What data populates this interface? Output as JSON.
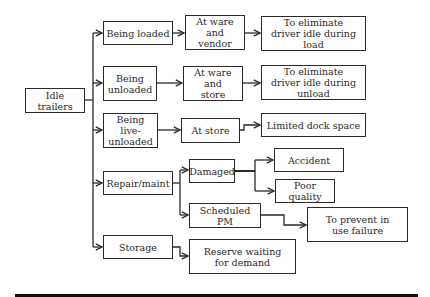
{
  "diagram": {
    "type": "tree",
    "root": {
      "id": "idle",
      "label": "Idle trailers"
    },
    "nodes": [
      {
        "id": "idle",
        "label": "Idle trailers",
        "x": 25,
        "y": 88,
        "w": 60,
        "h": 25
      },
      {
        "id": "loaded",
        "label": "Being loaded",
        "x": 103,
        "y": 21,
        "w": 70,
        "h": 24
      },
      {
        "id": "unloaded",
        "label": "Being unloaded",
        "x": 103,
        "y": 66,
        "w": 54,
        "h": 35
      },
      {
        "id": "live",
        "label": "Being live-unloaded",
        "x": 103,
        "y": 113,
        "w": 55,
        "h": 35
      },
      {
        "id": "repair",
        "label": "Repair/maint",
        "x": 103,
        "y": 171,
        "w": 70,
        "h": 24
      },
      {
        "id": "storage",
        "label": "Storage",
        "x": 103,
        "y": 235,
        "w": 70,
        "h": 24
      },
      {
        "id": "ware_vendor",
        "label": "At ware and vendor",
        "x": 185,
        "y": 15,
        "w": 60,
        "h": 35
      },
      {
        "id": "ware_store",
        "label": "At ware and store",
        "x": 183,
        "y": 66,
        "w": 60,
        "h": 35
      },
      {
        "id": "at_store",
        "label": "At store",
        "x": 181,
        "y": 118,
        "w": 59,
        "h": 25
      },
      {
        "id": "elim_load",
        "label": "To eliminate driver idle during load",
        "x": 261,
        "y": 16,
        "w": 105,
        "h": 35
      },
      {
        "id": "elim_unload",
        "label": "To eliminate driver idle during unload",
        "x": 261,
        "y": 65,
        "w": 105,
        "h": 35
      },
      {
        "id": "dock",
        "label": "Limited dock space",
        "x": 261,
        "y": 113,
        "w": 105,
        "h": 24
      },
      {
        "id": "damaged",
        "label": "Damaged",
        "x": 189,
        "y": 159,
        "w": 46,
        "h": 24
      },
      {
        "id": "sched_pm",
        "label": "Scheduled PM",
        "x": 189,
        "y": 203,
        "w": 72,
        "h": 25
      },
      {
        "id": "accident",
        "label": "Accident",
        "x": 274,
        "y": 148,
        "w": 70,
        "h": 24
      },
      {
        "id": "poor_quality",
        "label": "Poor quality",
        "x": 275,
        "y": 179,
        "w": 60,
        "h": 24
      },
      {
        "id": "prevent",
        "label": "To prevent in use failure",
        "x": 307,
        "y": 207,
        "w": 101,
        "h": 35
      },
      {
        "id": "reserve",
        "label": "Reserve waiting for demand",
        "x": 189,
        "y": 239,
        "w": 107,
        "h": 35
      }
    ],
    "edges": [
      {
        "from": "idle",
        "to": "loaded"
      },
      {
        "from": "idle",
        "to": "unloaded"
      },
      {
        "from": "idle",
        "to": "live"
      },
      {
        "from": "idle",
        "to": "repair"
      },
      {
        "from": "idle",
        "to": "storage"
      },
      {
        "from": "loaded",
        "to": "ware_vendor"
      },
      {
        "from": "unloaded",
        "to": "ware_store"
      },
      {
        "from": "live",
        "to": "at_store"
      },
      {
        "from": "ware_vendor",
        "to": "elim_load"
      },
      {
        "from": "ware_store",
        "to": "elim_unload"
      },
      {
        "from": "at_store",
        "to": "dock"
      },
      {
        "from": "repair",
        "to": "damaged"
      },
      {
        "from": "repair",
        "to": "sched_pm"
      },
      {
        "from": "damaged",
        "to": "accident"
      },
      {
        "from": "damaged",
        "to": "poor_quality"
      },
      {
        "from": "sched_pm",
        "to": "prevent"
      },
      {
        "from": "storage",
        "to": "reserve"
      }
    ]
  },
  "colors": {
    "stroke": "#2a2a2a",
    "background": "#ffffff",
    "rule": "#111111"
  }
}
